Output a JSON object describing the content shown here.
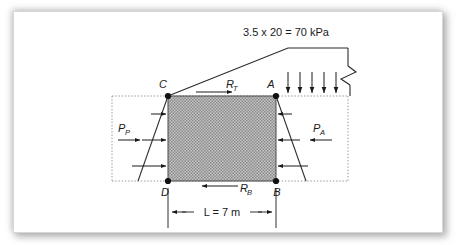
{
  "figure": {
    "surcharge_label": "3.5 x 20 = 70 kPa",
    "dimension": {
      "value_label": "L = 7 m",
      "symbol": "L",
      "equals": "=",
      "magnitude": "7",
      "unit": "m"
    },
    "points": [
      {
        "id": "C",
        "label": "C",
        "x": 168,
        "y": 96
      },
      {
        "id": "A",
        "label": "A",
        "x": 276,
        "y": 96
      },
      {
        "id": "D",
        "label": "D",
        "x": 168,
        "y": 181
      },
      {
        "id": "B",
        "label": "B",
        "x": 276,
        "y": 181
      }
    ],
    "forces": [
      {
        "id": "R_T",
        "base": "R",
        "sub": "T",
        "direction": "right",
        "position": "top-of-block"
      },
      {
        "id": "R_B",
        "base": "R",
        "sub": "B",
        "direction": "left",
        "position": "bottom-of-block"
      },
      {
        "id": "P_P",
        "base": "P",
        "sub": "P",
        "direction": "right",
        "position": "left-passive-wedge"
      },
      {
        "id": "P_A",
        "base": "P",
        "sub": "A",
        "direction": "left",
        "position": "right-active-wedge"
      }
    ],
    "surcharge_arrows": {
      "count": 5,
      "direction": "down",
      "xs": [
        288,
        300,
        312,
        324,
        336
      ],
      "y_top": 74,
      "y_bottom": 96
    },
    "pressure_arrows_left": {
      "count": 3,
      "direction": "right",
      "ys": [
        114,
        140,
        166
      ]
    },
    "pressure_arrows_right": {
      "count": 3,
      "direction": "left",
      "ys": [
        114,
        140,
        166
      ]
    },
    "colors": {
      "line": "#1a1a1a",
      "fill_hatch": "#9a9a9a",
      "fill_hatch_bg": "#bdbdbd",
      "dotted": "#808080",
      "background": "#ffffff",
      "frame_shadow": "#9b9b9b"
    },
    "geometry": {
      "block": {
        "x": 168,
        "y": 96,
        "width": 108,
        "height": 85
      },
      "ground_dotted_y_top": 96,
      "ground_dotted_y_bottom": 181,
      "dotted_box_left_x": 112,
      "dotted_box_right_x": 348,
      "slope_crest_x": 288,
      "slope_crest_y": 48,
      "break_symbol_x": 348
    }
  }
}
